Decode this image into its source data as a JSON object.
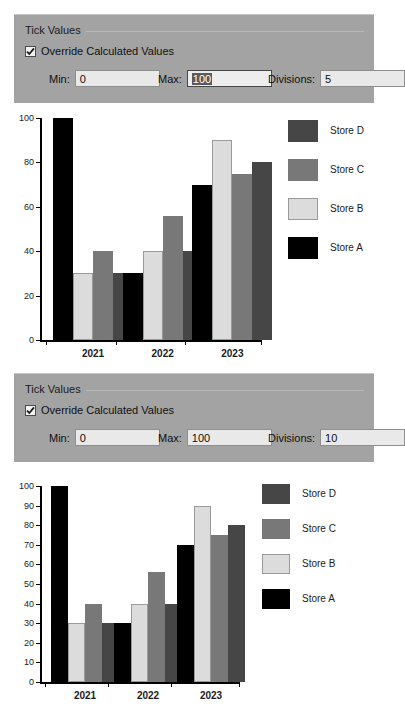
{
  "panels": [
    {
      "title": "Tick Values",
      "checkbox": {
        "label": "Override Calculated Values",
        "checked": true
      },
      "fields": [
        {
          "label": "Min:",
          "value": "0",
          "focused": false,
          "selected": false
        },
        {
          "label": "Max:",
          "value": "100",
          "focused": true,
          "selected": true
        },
        {
          "label": "Divisions:",
          "value": "5",
          "focused": false,
          "selected": false
        }
      ]
    },
    {
      "title": "Tick Values",
      "checkbox": {
        "label": "Override Calculated Values",
        "checked": true
      },
      "fields": [
        {
          "label": "Min:",
          "value": "0",
          "focused": false,
          "selected": false
        },
        {
          "label": "Max:",
          "value": "100",
          "focused": false,
          "selected": false
        },
        {
          "label": "Divisions:",
          "value": "10",
          "focused": false,
          "selected": false
        }
      ]
    }
  ],
  "colors": {
    "store_a": "#000000",
    "store_b": "#dcdcdc",
    "store_c": "#787878",
    "store_d": "#464646",
    "panel_bg": "#a3a3a3",
    "input_bg": "#e9e9e9",
    "selection_bg": "#5b5b5b",
    "axis": "#000000",
    "chart_bg": "#ffffff"
  },
  "chart_data": [
    {
      "type": "bar",
      "title": "",
      "xlabel": "",
      "ylabel": "",
      "categories": [
        "2021",
        "2022",
        "2023"
      ],
      "series": [
        {
          "name": "Store A",
          "color": "#000000",
          "values": [
            100,
            30,
            70
          ]
        },
        {
          "name": "Store B",
          "color": "#dcdcdc",
          "values": [
            30,
            40,
            90
          ]
        },
        {
          "name": "Store C",
          "color": "#787878",
          "values": [
            40,
            56,
            75
          ]
        },
        {
          "name": "Store D",
          "color": "#464646",
          "values": [
            30,
            40,
            80
          ]
        }
      ],
      "ylim": [
        0,
        100
      ],
      "yticks": [
        0,
        20,
        40,
        60,
        80,
        100
      ],
      "divisions": 5,
      "grid": false,
      "legend_position": "right",
      "legend_order": [
        "Store D",
        "Store C",
        "Store B",
        "Store A"
      ]
    },
    {
      "type": "bar",
      "title": "",
      "xlabel": "",
      "ylabel": "",
      "categories": [
        "2021",
        "2022",
        "2023"
      ],
      "series": [
        {
          "name": "Store A",
          "color": "#000000",
          "values": [
            100,
            30,
            70
          ]
        },
        {
          "name": "Store B",
          "color": "#dcdcdc",
          "values": [
            30,
            40,
            90
          ]
        },
        {
          "name": "Store C",
          "color": "#787878",
          "values": [
            40,
            56,
            75
          ]
        },
        {
          "name": "Store D",
          "color": "#464646",
          "values": [
            30,
            40,
            80
          ]
        }
      ],
      "ylim": [
        0,
        100
      ],
      "yticks": [
        0,
        10,
        20,
        30,
        40,
        50,
        60,
        70,
        80,
        90,
        100
      ],
      "divisions": 10,
      "grid": false,
      "legend_position": "right",
      "legend_order": [
        "Store D",
        "Store C",
        "Store B",
        "Store A"
      ]
    }
  ]
}
